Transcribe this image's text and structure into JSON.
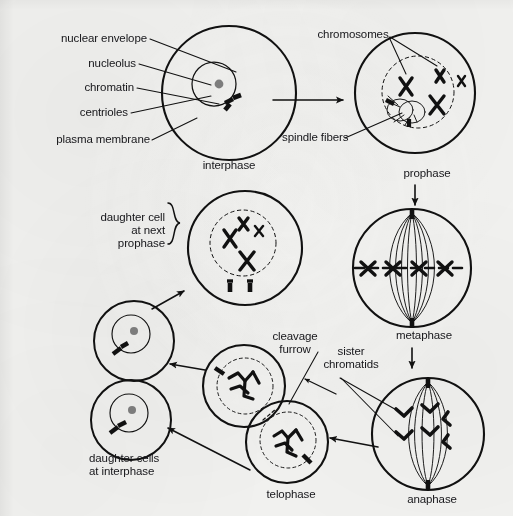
{
  "diagram": {
    "background_color": "#f1f1ef",
    "ink_color": "#111111",
    "nucleolus_color": "#7b7b7b"
  },
  "part_labels": [
    {
      "id": "nuclear-envelope",
      "text": "nuclear envelope"
    },
    {
      "id": "nucleolus",
      "text": "nucleolus"
    },
    {
      "id": "chromatin",
      "text": "chromatin"
    },
    {
      "id": "centrioles",
      "text": "centrioles"
    },
    {
      "id": "plasma-membrane",
      "text": "plasma membrane"
    },
    {
      "id": "chromosomes",
      "text": "chromosomes"
    },
    {
      "id": "spindle-fibers",
      "text": "spindle fibers"
    },
    {
      "id": "cleavage-furrow",
      "text": "cleavage\nfurrow"
    },
    {
      "id": "sister-chromatids",
      "text": "sister\nchromatids"
    },
    {
      "id": "daughter-cell-next-prophase",
      "text": "daughter cell\nat next\nprophase"
    },
    {
      "id": "daughter-cells-interphase",
      "text": "daughter cells\nat interphase"
    }
  ],
  "stages": [
    {
      "id": "interphase",
      "label": "interphase",
      "order": 1
    },
    {
      "id": "prophase",
      "label": "prophase",
      "order": 2
    },
    {
      "id": "metaphase",
      "label": "metaphase",
      "order": 3
    },
    {
      "id": "anaphase",
      "label": "anaphase",
      "order": 4
    },
    {
      "id": "telophase",
      "label": "telophase",
      "order": 5
    }
  ],
  "labels": {
    "nuclear_envelope": "nuclear envelope",
    "nucleolus": "nucleolus",
    "chromatin": "chromatin",
    "centrioles": "centrioles",
    "plasma_membrane": "plasma membrane",
    "chromosomes": "chromosomes",
    "spindle_fibers": "spindle fibers",
    "cleavage_furrow_l1": "cleavage",
    "cleavage_furrow_l2": "furrow",
    "sister_chromatids_l1": "sister",
    "sister_chromatids_l2": "chromatids",
    "daughter_next_l1": "daughter cell",
    "daughter_next_l2": "at next",
    "daughter_next_l3": "prophase",
    "daughter_interphase_l1": "daughter cells",
    "daughter_interphase_l2": "at interphase",
    "interphase": "interphase",
    "prophase": "prophase",
    "metaphase": "metaphase",
    "anaphase": "anaphase",
    "telophase": "telophase"
  }
}
